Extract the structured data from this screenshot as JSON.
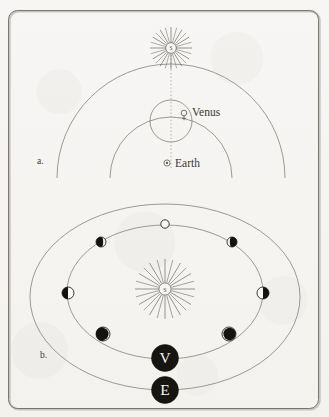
{
  "figure": {
    "panels": [
      {
        "key": "a",
        "label": "a.",
        "model": "ptolemaic-epicycle",
        "bodies": [
          {
            "name": "Sun",
            "symbol_letter": "S",
            "label": "",
            "glyph": "sun-rayed"
          },
          {
            "name": "Venus",
            "symbol_letter": "",
            "label": "Venus",
            "glyph": "venus-symbol"
          },
          {
            "name": "Earth",
            "symbol_letter": "",
            "label": "Earth",
            "glyph": "earth-symbol"
          }
        ],
        "curves": [
          "deferent-arc",
          "epicycle-circle",
          "earth-arc",
          "sun-earth-line"
        ]
      },
      {
        "key": "b",
        "label": "b.",
        "model": "copernican-heliocentric",
        "bodies": [
          {
            "name": "Sun",
            "symbol_letter": "S",
            "label": "",
            "glyph": "sun-rayed"
          },
          {
            "name": "Venus",
            "symbol_letter": "V",
            "label": "V",
            "glyph": "labeled-disc"
          },
          {
            "name": "Earth",
            "symbol_letter": "E",
            "label": "E",
            "glyph": "labeled-disc"
          }
        ],
        "curves": [
          "venus-orbit-ellipse",
          "earth-orbit-ellipse"
        ],
        "phases": [
          {
            "position": "top",
            "name": "full",
            "lit_fraction": 1.0,
            "dark_side": "none"
          },
          {
            "position": "upper-left",
            "name": "gibbous-left",
            "lit_fraction": 0.8,
            "dark_side": "left"
          },
          {
            "position": "upper-right",
            "name": "gibbous-right",
            "lit_fraction": 0.8,
            "dark_side": "right"
          },
          {
            "position": "left",
            "name": "half-left",
            "lit_fraction": 0.5,
            "dark_side": "left"
          },
          {
            "position": "right",
            "name": "half-right",
            "lit_fraction": 0.5,
            "dark_side": "right"
          },
          {
            "position": "lower-left",
            "name": "crescent-left",
            "lit_fraction": 0.15,
            "dark_side": "left"
          },
          {
            "position": "lower-right",
            "name": "crescent-right",
            "lit_fraction": 0.15,
            "dark_side": "right"
          },
          {
            "position": "bottom",
            "name": "new",
            "lit_fraction": 0.0,
            "dark_side": "all"
          }
        ]
      }
    ]
  },
  "colors": {
    "paper": "#f6f5f3",
    "ink": "#4a4641",
    "line": "#8d8881",
    "dark_body": "#1b1917",
    "frame": "#8b867f",
    "text": "#3a3733"
  }
}
